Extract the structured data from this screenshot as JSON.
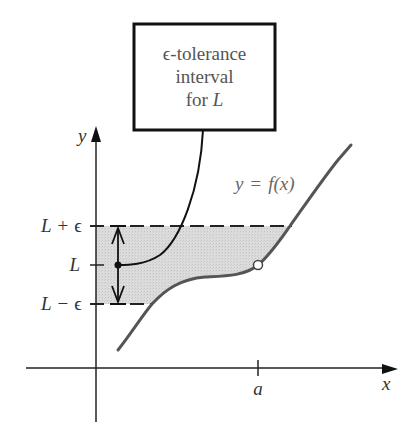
{
  "callout": {
    "line1": "ϵ-tolerance",
    "line2": "interval",
    "line3_prefix": "for ",
    "line3_var": "L"
  },
  "axes": {
    "x_label": "x",
    "y_label": "y",
    "x_tick_label": "a"
  },
  "y_ticks": {
    "upper": {
      "L": "L",
      "op": "+",
      "eps": "ϵ"
    },
    "middle": {
      "L": "L"
    },
    "lower": {
      "L": "L",
      "op": "−",
      "eps": "ϵ"
    }
  },
  "curve": {
    "label_y": "y",
    "label_eq": "=",
    "label_f": "f(x)"
  },
  "colors": {
    "axis": "#222222",
    "curve": "#555555",
    "band_fill": "#d8d8d8",
    "dash": "#222222",
    "text": "#333333"
  }
}
